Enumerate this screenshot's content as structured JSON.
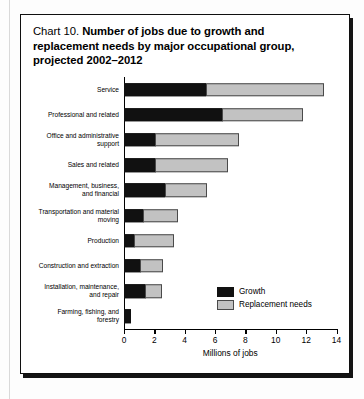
{
  "figure": {
    "title_lead": "Chart 10.",
    "title_main_line1": "Number of jobs due to growth and",
    "title_main_line2": "replacement needs by major occupational group,",
    "title_main_line3": "projected 2002–2012"
  },
  "legend": {
    "position": "inside-right",
    "items": [
      {
        "label": "Growth",
        "color": "#111111",
        "swatch": "growth-swatch"
      },
      {
        "label": "Replacement needs",
        "color": "#c2c2c2",
        "swatch": "replacement-swatch"
      }
    ]
  },
  "axis": {
    "xlabel": "Millions of jobs",
    "xticks": [
      "0",
      "2",
      "4",
      "6",
      "8",
      "10",
      "12",
      "14"
    ]
  },
  "chart_data": {
    "type": "bar",
    "orientation": "horizontal",
    "stacked": true,
    "title": "Chart 10. Number of jobs due to growth and replacement needs by major occupational group, projected 2002–2012",
    "xlabel": "Millions of jobs",
    "ylabel": "",
    "xlim": [
      0,
      14
    ],
    "xticks": [
      0,
      2,
      4,
      6,
      8,
      10,
      12,
      14
    ],
    "grid": false,
    "legend_position": "inside-right",
    "categories": [
      "Service",
      "Professional and related",
      "Office and administrative\nsupport",
      "Sales and related",
      "Management, business,\nand financial",
      "Transportation and material\nmoving",
      "Production",
      "Construction and extraction",
      "Installation, maintenance,\nand repair",
      "Farming, fishing, and\nforestry"
    ],
    "series": [
      {
        "name": "Growth",
        "color": "#111111",
        "values": [
          5.4,
          6.5,
          2.1,
          2.1,
          2.7,
          1.3,
          0.7,
          1.1,
          1.4,
          0.45
        ]
      },
      {
        "name": "Replacement needs",
        "color": "#c2c2c2",
        "values": [
          7.8,
          5.3,
          5.5,
          4.8,
          2.8,
          2.3,
          2.6,
          1.5,
          1.1,
          0.0
        ]
      }
    ],
    "totals": [
      13.2,
      11.8,
      7.6,
      6.9,
      5.5,
      3.6,
      3.3,
      2.6,
      2.5,
      0.45
    ]
  }
}
